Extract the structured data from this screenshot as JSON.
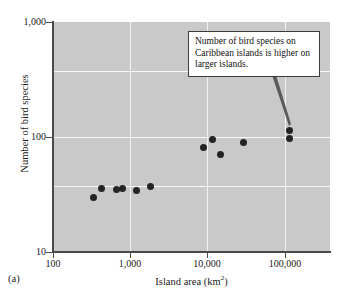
{
  "figure": {
    "panel_label": "(a)",
    "annotation": "Number of bird species on Caribbean islands is higher on larger islands.",
    "plot_bg_color": "#c9c9c9",
    "point_color": "#242424",
    "grid_color": "#f2f2f2"
  },
  "chart_data": {
    "type": "scatter",
    "title": "",
    "xlabel": "Island area (km",
    "xlabel_exponent": "2",
    "xlabel_suffix": ")",
    "ylabel": "Number of bird species",
    "xscale": "log",
    "yscale": "log",
    "xlim": [
      100,
      300000
    ],
    "ylim": [
      10,
      1000
    ],
    "xticks": [
      100,
      1000,
      10000,
      100000
    ],
    "xticklabels": [
      "100",
      "1,000",
      "10,000",
      "100,000"
    ],
    "yticks": [
      10,
      100,
      1000
    ],
    "yticklabels": [
      "10",
      "100",
      "1,000"
    ],
    "grid": true,
    "legend": "none",
    "annotations": [
      {
        "text": "Number of bird species on Caribbean islands is higher on larger islands.",
        "points_to": {
          "x": 115000,
          "y": 115
        }
      }
    ],
    "points": [
      {
        "x": 330,
        "y": 30
      },
      {
        "x": 430,
        "y": 36
      },
      {
        "x": 660,
        "y": 35
      },
      {
        "x": 800,
        "y": 36
      },
      {
        "x": 1200,
        "y": 34
      },
      {
        "x": 1800,
        "y": 37
      },
      {
        "x": 8800,
        "y": 81
      },
      {
        "x": 11500,
        "y": 96
      },
      {
        "x": 14500,
        "y": 71
      },
      {
        "x": 29000,
        "y": 89
      },
      {
        "x": 115000,
        "y": 115
      },
      {
        "x": 115000,
        "y": 97
      }
    ]
  },
  "ticklabels": {
    "y": {
      "top": "1,000",
      "mid": "100",
      "bottom": "10"
    },
    "x": {
      "t1": "100",
      "t2": "1,000",
      "t3": "10,000",
      "t4": "100,000"
    }
  }
}
